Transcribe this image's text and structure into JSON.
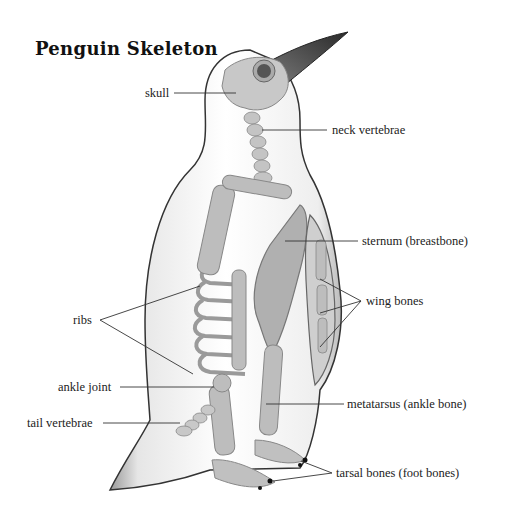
{
  "diagram": {
    "title": "Penguin Skeleton",
    "labels": {
      "skull": "skull",
      "neck_vertebrae": "neck vertebrae",
      "sternum": "sternum (breastbone)",
      "wing_bones": "wing bones",
      "ribs": "ribs",
      "ankle_joint": "ankle joint",
      "tail_vertebrae": "tail vertebrae",
      "metatarsus": "metatarsus (ankle bone)",
      "tarsal_bones": "tarsal bones (foot bones)"
    },
    "colors": {
      "background": "#ffffff",
      "bone": "#bdbdbd",
      "bone_dark": "#8f8f8f",
      "body_outline": "#333333",
      "beak": "#3a3a3a",
      "leader_line": "#333333"
    }
  }
}
